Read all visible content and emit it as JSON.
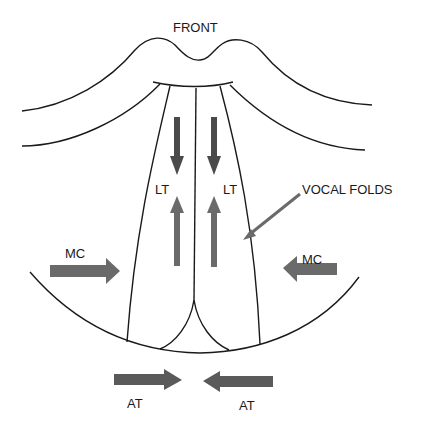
{
  "diagram": {
    "labels": {
      "front": "FRONT",
      "lt_left": "LT",
      "lt_right": "LT",
      "vocal_folds": "VOCAL FOLDS",
      "mc_left": "MC",
      "mc_right": "MC",
      "at_left": "AT",
      "at_right": "AT"
    },
    "colors": {
      "line": "#1a1a1a",
      "arrow": "#6a6a6a",
      "arrow_dark": "#4a4a4a",
      "background": "#ffffff"
    }
  }
}
